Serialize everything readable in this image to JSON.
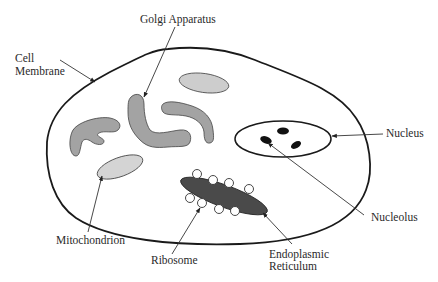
{
  "diagram": {
    "title": "",
    "colors": {
      "background": "#ffffff",
      "membrane": "#1a1a1a",
      "golgi": "#a3a3a3",
      "mitochondrion": "#d4d4d4",
      "vesicle": "#cdcdcd",
      "endoplasmic_reticulum": "#4a4a4a",
      "nucleolus": "#111111",
      "ribosome_fill": "#ffffff",
      "text": "#2a2a2a"
    },
    "labels": {
      "golgi": "Golgi Apparatus",
      "cell_membrane_line1": "Cell",
      "cell_membrane_line2": "Membrane",
      "nucleus": "Nucleus",
      "nucleolus": "Nucleolus",
      "mitochondrion": "Mitochondrion",
      "ribosome": "Ribosome",
      "er_line1": "Endoplasmic",
      "er_line2": "Reticulum"
    },
    "components": [
      "Cell Membrane",
      "Golgi Apparatus",
      "Nucleus",
      "Nucleolus",
      "Mitochondrion",
      "Ribosome",
      "Endoplasmic Reticulum"
    ]
  }
}
